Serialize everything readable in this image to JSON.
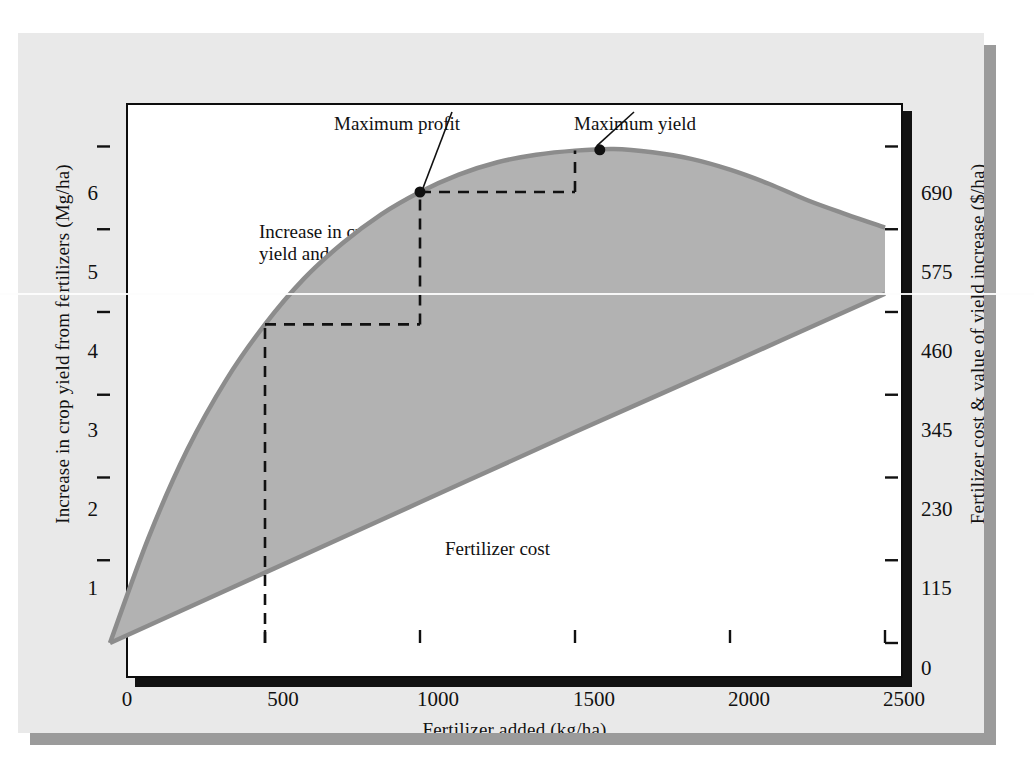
{
  "figure": {
    "background_color": "#e9e9e9",
    "plot_background_color": "#ffffff",
    "shadow_color": "#9b9b9b"
  },
  "chart_data": {
    "type": "area",
    "title": "",
    "subtitle": "",
    "xlabel": "Fertilizer added (kg/ha)",
    "ylabel": "Increase in crop yield from fertilizers (Mg/ha)",
    "y2label": "Fertilizer cost & value of yield increase ($/ha)",
    "xlim": [
      0,
      2500
    ],
    "ylim": [
      0,
      6.9
    ],
    "y2lim": [
      0,
      793.5
    ],
    "grid": false,
    "legend": "none",
    "xticks": [
      0,
      500,
      1000,
      1500,
      2000,
      2500
    ],
    "xticklabels": [
      "0",
      "500",
      "1000",
      "1500",
      "2000",
      "2500"
    ],
    "yticks": [
      1,
      2,
      3,
      4,
      5,
      6
    ],
    "yticklabels": [
      "1",
      "2",
      "3",
      "4",
      "5",
      "6"
    ],
    "y2ticks": [
      0,
      115,
      230,
      345,
      460,
      575,
      690
    ],
    "y2ticklabels": [
      "0",
      "115",
      "230",
      "345",
      "460",
      "575",
      "690"
    ],
    "fill_color": "#b2b2b2",
    "curve_color": "#8c8c8c",
    "series": [
      {
        "name": "Increase in crop yield and value",
        "type": "line",
        "x": [
          0,
          125,
          250,
          375,
          500,
          625,
          750,
          875,
          1000,
          1125,
          1250,
          1375,
          1500,
          1625,
          1750,
          1875,
          2000,
          2125,
          2250,
          2375,
          2500
        ],
        "y": [
          0.0,
          1.28,
          2.34,
          3.18,
          3.85,
          4.4,
          4.83,
          5.18,
          5.45,
          5.66,
          5.81,
          5.9,
          5.95,
          5.97,
          5.93,
          5.85,
          5.72,
          5.55,
          5.35,
          5.18,
          5.02
        ]
      },
      {
        "name": "Fertilizer cost",
        "type": "line",
        "x": [
          0,
          500,
          1000,
          1500,
          2000,
          2500
        ],
        "y": [
          0.0,
          0.85,
          1.7,
          2.55,
          3.38,
          4.22
        ]
      }
    ],
    "annotations": [
      {
        "name": "maximum-profit",
        "label": "Maximum profit",
        "x": 1000,
        "y": 5.45,
        "marker": true
      },
      {
        "name": "maximum-yield",
        "label": "Maximum yield",
        "x": 1580,
        "y": 5.96,
        "marker": true
      },
      {
        "name": "increase-in-crop-yield-and-value",
        "label": "Increase in crop yield and value",
        "marker": false
      },
      {
        "name": "profit-region",
        "label": "Profit",
        "marker": false
      },
      {
        "name": "fertilizer-cost-line",
        "label": "Fertilizer cost",
        "marker": false
      }
    ],
    "guide_lines": [
      {
        "name": "guide-500",
        "x": 500,
        "y": 3.85,
        "style": "dashed"
      },
      {
        "name": "guide-1000",
        "x": 1000,
        "y": 5.45,
        "style": "dashed"
      },
      {
        "name": "guide-1500",
        "x": 1500,
        "y": 5.95,
        "style": "dashed"
      }
    ]
  },
  "annotations": {
    "maximum_profit": "Maximum profit",
    "maximum_yield": "Maximum yield",
    "increase_in_crop_yield_and_value": "Increase in crop yield and value",
    "profit": "Profit",
    "fertilizer_cost": "Fertilizer cost"
  },
  "axes": {
    "x_title": "Fertilizer added (kg/ha)",
    "y_left_title": "Increase in crop yield from fertilizers (Mg/ha)",
    "y_right_title": "Fertilizer cost & value of yield increase ($/ha)",
    "x_ticks": [
      "0",
      "500",
      "1000",
      "1500",
      "2000",
      "2500"
    ],
    "y_left_ticks": [
      "6",
      "5",
      "4",
      "3",
      "2",
      "1"
    ],
    "y_right_ticks": [
      "690",
      "575",
      "460",
      "345",
      "230",
      "115",
      "0"
    ]
  }
}
